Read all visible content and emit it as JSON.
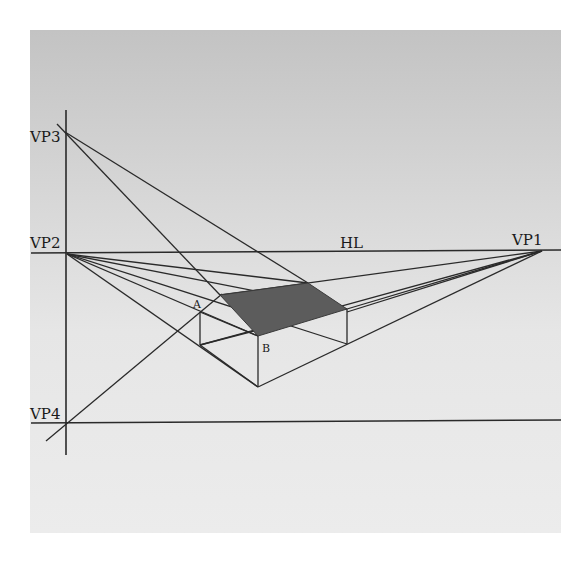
{
  "diagram": {
    "panel": {
      "x": 30,
      "y": 30,
      "width": 531,
      "height": 503,
      "gradient_top": "#c3c3c3",
      "gradient_mid": "#e2e2e2",
      "gradient_bottom": "#ececec"
    },
    "colors": {
      "line": "#2a2a2a",
      "shaded_face": "#5c5c5c",
      "label": "#1a1a1a"
    },
    "labels": {
      "vp1": "VP1",
      "vp2": "VP2",
      "vp3": "VP3",
      "vp4": "VP4",
      "horizon": "HL",
      "point_a": "A",
      "point_b": "B"
    },
    "points": {
      "VP1": [
        542,
        251
      ],
      "VP2": [
        67,
        254
      ],
      "VP3": [
        65,
        132
      ],
      "VP4": [
        67,
        422
      ],
      "A_top": [
        200,
        312
      ],
      "A_bottom": [
        200,
        345
      ],
      "B_top": [
        258,
        336
      ],
      "B_bottom": [
        258,
        387
      ],
      "R_top": [
        347,
        309
      ],
      "R_bottom": [
        347,
        344
      ],
      "T_left": [
        220,
        295
      ],
      "T_right": [
        308,
        283
      ]
    },
    "shaded_face": [
      "T_left",
      "T_right",
      "R_top",
      "B_top"
    ]
  }
}
